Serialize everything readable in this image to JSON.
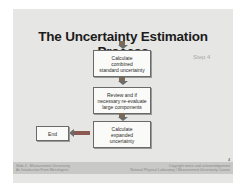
{
  "slide": {
    "title": "The Uncertainty Estimation Process",
    "step_label": "Step 4",
    "page_number": "4",
    "boxes": [
      {
        "lines": [
          "Calculate",
          "combined",
          "standard uncertainty"
        ]
      },
      {
        "lines": [
          "Review and if",
          "necessary re-evaluate",
          "large components"
        ]
      },
      {
        "lines": [
          "Calculate",
          "expanded",
          "uncertainty"
        ]
      },
      {
        "lines": [
          "End"
        ]
      }
    ],
    "footer": {
      "left_line1": "Slide 4 - Measurement Uncertainty",
      "left_line2": "An Introduction From Metrologists",
      "right_line1": "Copyright notice and acknowledgement",
      "right_line2": "National Physical Laboratory / Measurement Uncertainty Course"
    }
  }
}
